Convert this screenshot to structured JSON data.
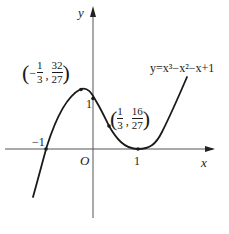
{
  "figure": {
    "type": "function-graph",
    "function_label": "y=x³−x²−x+1",
    "axes": {
      "x_label": "x",
      "y_label": "y",
      "origin_label": "O"
    },
    "tick_labels": {
      "x_neg_one": "−1",
      "x_one": "1",
      "y_one": "1"
    },
    "points": [
      {
        "name": "local-maximum",
        "x_sign": "−",
        "x_num": "1",
        "x_den": "3",
        "y_num": "32",
        "y_den": "27",
        "separator": ","
      },
      {
        "name": "inflection-point",
        "x_sign": "",
        "x_num": "1",
        "x_den": "3",
        "y_num": "16",
        "y_den": "27",
        "separator": ","
      }
    ],
    "colors": {
      "curve": "#1a1a1a",
      "axes": "#555555",
      "background": "#ffffff"
    }
  }
}
